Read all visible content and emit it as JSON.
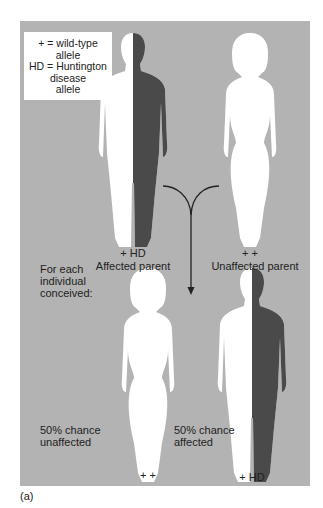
{
  "legend": {
    "line1": "+ = wild-type",
    "line2": "allele",
    "line3": "HD = Huntington",
    "line4": "disease",
    "line5": "allele"
  },
  "parents": [
    {
      "genotype": "+ HD",
      "label": "Affected parent",
      "status": "affected"
    },
    {
      "genotype": "+ +",
      "label": "Unaffected parent",
      "status": "unaffected"
    }
  ],
  "offspring_intro": [
    "For each",
    "individual",
    "conceived:"
  ],
  "offspring": [
    {
      "genotype": "+ +",
      "chance_line1": "50% chance",
      "chance_line2": "unaffected",
      "status": "unaffected"
    },
    {
      "genotype": "+ HD",
      "chance_line1": "50% chance",
      "chance_line2": "affected",
      "status": "affected"
    }
  ],
  "caption": "(a)",
  "colors": {
    "background": "#b3b3b3",
    "affected_half": "#4a4a4a",
    "silhouette": "#ffffff"
  }
}
